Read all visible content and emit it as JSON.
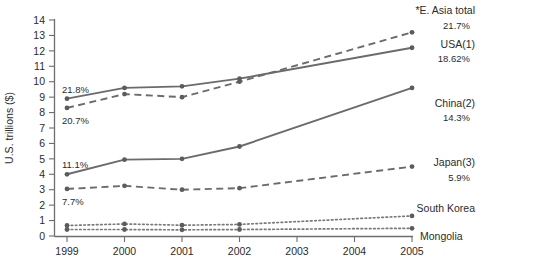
{
  "chart_data": {
    "type": "line",
    "title": "",
    "subtitle": "",
    "xlabel": "",
    "ylabel": "U.S. trillions ($)",
    "x": [
      1999,
      2000,
      2001,
      2002,
      2003,
      2004,
      2005
    ],
    "xticklabels": [
      "1999",
      "2000",
      "2001",
      "2002",
      "2003",
      "2004",
      "2005"
    ],
    "yticklabels": [
      "0",
      "1",
      "2",
      "3",
      "4",
      "5",
      "6",
      "7",
      "8",
      "9",
      "10",
      "11",
      "12",
      "13",
      "14"
    ],
    "ylim": [
      0,
      14
    ],
    "ytick_step": 1,
    "grid": false,
    "legend": "inline-right-labels",
    "series": [
      {
        "name": "*E. Asia total",
        "style": "dashed",
        "end_label": "*E. Asia total",
        "end_value_label": "21.7%",
        "start_value_label": "20.7%",
        "x": [
          1999,
          2000,
          2001,
          2002,
          2005
        ],
        "values": [
          8.3,
          9.2,
          9.0,
          10.0,
          13.2
        ]
      },
      {
        "name": "USA(1)",
        "style": "solid",
        "end_label": "USA(1)",
        "end_value_label": "18.62%",
        "start_value_label": "21.8%",
        "x": [
          1999,
          2000,
          2001,
          2002,
          2005
        ],
        "values": [
          8.9,
          9.6,
          9.7,
          10.2,
          12.2
        ]
      },
      {
        "name": "China(2)",
        "style": "solid",
        "end_label": "China(2)",
        "end_value_label": "14.3%",
        "start_value_label": "11.1%",
        "x": [
          1999,
          2000,
          2001,
          2002,
          2005
        ],
        "values": [
          4.0,
          4.95,
          5.0,
          5.8,
          9.6
        ]
      },
      {
        "name": "Japan(3)",
        "style": "dashed",
        "end_label": "Japan(3)",
        "end_value_label": "5.9%",
        "start_value_label": "7.7%",
        "x": [
          1999,
          2000,
          2001,
          2002,
          2005
        ],
        "values": [
          3.05,
          3.25,
          3.0,
          3.1,
          4.5
        ]
      },
      {
        "name": "South Korea",
        "style": "dotted",
        "end_label": "South Korea",
        "end_value_label": "",
        "start_value_label": "",
        "x": [
          1999,
          2000,
          2001,
          2002,
          2005
        ],
        "values": [
          0.68,
          0.78,
          0.7,
          0.75,
          1.3
        ]
      },
      {
        "name": "Mongolia",
        "style": "dotted",
        "end_label": "Mongolia",
        "end_value_label": "",
        "start_value_label": "",
        "x": [
          1999,
          2000,
          2001,
          2002,
          2005
        ],
        "values": [
          0.42,
          0.42,
          0.4,
          0.42,
          0.5
        ]
      }
    ],
    "colors": {
      "line": "#6b6b6b",
      "axis": "#6e6e6e",
      "text": "#2b2b2b",
      "background": "#ffffff"
    }
  }
}
